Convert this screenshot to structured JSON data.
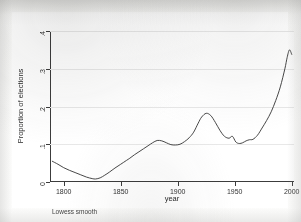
{
  "figure": {
    "note": "Lowess smooth",
    "background_color": "#ffffff",
    "line_color": "#333333",
    "grid_color": "#e8e8e8",
    "axis_color": "#3c3c3c"
  },
  "chart_data": {
    "type": "line",
    "title": "",
    "subtitle": "",
    "xlabel": "year",
    "ylabel": "Proportion of elections",
    "annotation": "Lowess smooth",
    "grid": true,
    "legend": "none",
    "xlim": [
      1788,
      2002
    ],
    "ylim": [
      0,
      0.4
    ],
    "xticks": [
      1800,
      1850,
      1900,
      1950,
      2000
    ],
    "xtick_labels": [
      "1800",
      "1850",
      "1900",
      "1950",
      "2000"
    ],
    "yticks": [
      0,
      0.1,
      0.2,
      0.3,
      0.4
    ],
    "ytick_labels": [
      "0",
      ".1",
      ".2",
      ".3",
      ".4"
    ],
    "series": [
      {
        "name": "Lowess smooth",
        "x": [
          1790,
          1795,
          1800,
          1805,
          1810,
          1815,
          1820,
          1825,
          1828,
          1832,
          1836,
          1840,
          1845,
          1850,
          1855,
          1858,
          1862,
          1866,
          1870,
          1874,
          1878,
          1882,
          1886,
          1890,
          1894,
          1898,
          1902,
          1906,
          1910,
          1914,
          1918,
          1921,
          1925,
          1929,
          1933,
          1937,
          1941,
          1945,
          1948,
          1951,
          1954,
          1957,
          1960,
          1963,
          1966,
          1970,
          1974,
          1978,
          1982,
          1986,
          1990,
          1994,
          1996,
          1998,
          2000
        ],
        "y": [
          0.055,
          0.047,
          0.038,
          0.031,
          0.025,
          0.019,
          0.013,
          0.009,
          0.008,
          0.011,
          0.018,
          0.026,
          0.037,
          0.047,
          0.057,
          0.063,
          0.072,
          0.08,
          0.088,
          0.096,
          0.104,
          0.11,
          0.109,
          0.104,
          0.099,
          0.098,
          0.1,
          0.107,
          0.117,
          0.132,
          0.156,
          0.172,
          0.182,
          0.176,
          0.158,
          0.137,
          0.121,
          0.116,
          0.121,
          0.106,
          0.102,
          0.104,
          0.109,
          0.112,
          0.113,
          0.124,
          0.143,
          0.163,
          0.186,
          0.216,
          0.252,
          0.3,
          0.33,
          0.35,
          0.338
        ]
      }
    ]
  }
}
